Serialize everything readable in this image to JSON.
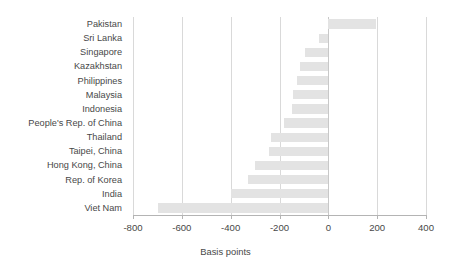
{
  "chart_data": {
    "type": "bar",
    "orientation": "horizontal",
    "title": "",
    "xlabel": "Basis points",
    "ylabel": "",
    "xlim": [
      -800,
      400
    ],
    "ylim": null,
    "grid": true,
    "legend": null,
    "xticks": [
      -800,
      -600,
      -400,
      -200,
      0,
      200,
      400
    ],
    "xtick_labels": [
      "-800",
      "-600",
      "-400",
      "-200",
      "0",
      "200",
      "400"
    ],
    "categories": [
      "Pakistan",
      "Sri Lanka",
      "Singapore",
      "Kazakhstan",
      "Philippines",
      "Malaysia",
      "Indonesia",
      "People's Rep. of China",
      "Thailand",
      "Taipei, China",
      "Hong Kong, China",
      "Rep. of Korea",
      "India",
      "Viet Nam"
    ],
    "values": [
      195,
      -40,
      -95,
      -115,
      -130,
      -145,
      -150,
      -180,
      -235,
      -245,
      -300,
      -330,
      -400,
      -698
    ],
    "bar_color": "#e3e3e3",
    "grid_color": "#d9d9d9",
    "axis_color": "#b4b4b4",
    "text_color": "#484848"
  }
}
